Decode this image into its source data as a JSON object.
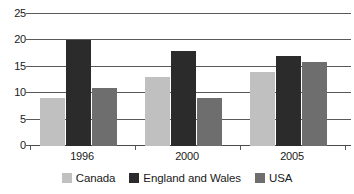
{
  "chart_data": {
    "type": "bar",
    "title": "",
    "subtitle": "",
    "xlabel": "",
    "ylabel": "",
    "categories": [
      "1996",
      "2000",
      "2005"
    ],
    "series": [
      {
        "name": "Canada",
        "color": "#c0c0c0",
        "values": [
          9,
          13,
          14
        ]
      },
      {
        "name": "England and Wales",
        "color": "#2b2b2b",
        "values": [
          20,
          18,
          17
        ]
      },
      {
        "name": "USA",
        "color": "#6e6e6e",
        "values": [
          11,
          9,
          16
        ]
      }
    ],
    "ylim": [
      0,
      25
    ],
    "yticks": [
      0,
      5,
      10,
      15,
      20,
      25
    ],
    "ytick_labels": [
      "0",
      "5",
      "10",
      "15",
      "20",
      "25"
    ],
    "grid": true,
    "grid_axis": "y",
    "legend_position": "bottom",
    "annotations": []
  },
  "axis": {
    "y_labels": [
      "25",
      "20",
      "15",
      "10",
      "5",
      "0"
    ]
  },
  "legend": {
    "items": [
      {
        "label": "Canada",
        "color": "#c0c0c0"
      },
      {
        "label": "England and Wales",
        "color": "#2b2b2b"
      },
      {
        "label": "USA",
        "color": "#6e6e6e"
      }
    ]
  }
}
